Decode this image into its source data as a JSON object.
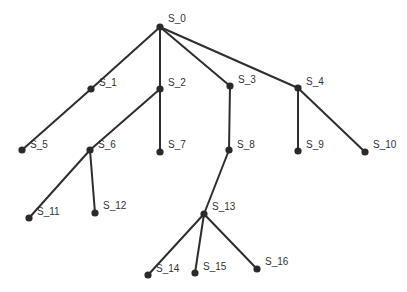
{
  "diagram": {
    "type": "tree",
    "colors": {
      "edge": "#2e2e2e",
      "node": "#2a2a2a",
      "label": "#333333",
      "background": "#ffffff"
    },
    "nodes": [
      {
        "id": "S_0",
        "label": "S_0",
        "x": 160,
        "y": 27,
        "lx": 168,
        "ly": 22
      },
      {
        "id": "S_1",
        "label": "S_1",
        "x": 91,
        "y": 89,
        "lx": 99,
        "ly": 86
      },
      {
        "id": "S_2",
        "label": "S_2",
        "x": 160,
        "y": 89,
        "lx": 168,
        "ly": 86
      },
      {
        "id": "S_3",
        "label": "S_3",
        "x": 230,
        "y": 86,
        "lx": 238,
        "ly": 83
      },
      {
        "id": "S_4",
        "label": "S_4",
        "x": 298,
        "y": 88,
        "lx": 306,
        "ly": 85
      },
      {
        "id": "S_5",
        "label": "S_5",
        "x": 22,
        "y": 150,
        "lx": 30,
        "ly": 148
      },
      {
        "id": "S_6",
        "label": "S_6",
        "x": 90,
        "y": 150,
        "lx": 98,
        "ly": 148
      },
      {
        "id": "S_7",
        "label": "S_7",
        "x": 160,
        "y": 152,
        "lx": 168,
        "ly": 148
      },
      {
        "id": "S_8",
        "label": "S_8",
        "x": 229,
        "y": 150,
        "lx": 237,
        "ly": 148
      },
      {
        "id": "S_9",
        "label": "S_9",
        "x": 298,
        "y": 151,
        "lx": 306,
        "ly": 148
      },
      {
        "id": "S_10",
        "label": "S_10",
        "x": 365,
        "y": 152,
        "lx": 373,
        "ly": 148
      },
      {
        "id": "S_11",
        "label": "S_11",
        "x": 29,
        "y": 218,
        "lx": 37,
        "ly": 215
      },
      {
        "id": "S_12",
        "label": "S_12",
        "x": 95,
        "y": 213,
        "lx": 103,
        "ly": 209
      },
      {
        "id": "S_13",
        "label": "S_13",
        "x": 204,
        "y": 214,
        "lx": 212,
        "ly": 210
      },
      {
        "id": "S_14",
        "label": "S_14",
        "x": 148,
        "y": 275,
        "lx": 156,
        "ly": 272
      },
      {
        "id": "S_15",
        "label": "S_15",
        "x": 195,
        "y": 273,
        "lx": 203,
        "ly": 270
      },
      {
        "id": "S_16",
        "label": "S_16",
        "x": 257,
        "y": 269,
        "lx": 265,
        "ly": 265
      }
    ],
    "edges": [
      {
        "from": "S_0",
        "to": "S_1"
      },
      {
        "from": "S_0",
        "to": "S_2"
      },
      {
        "from": "S_0",
        "to": "S_3"
      },
      {
        "from": "S_0",
        "to": "S_4"
      },
      {
        "from": "S_1",
        "to": "S_5"
      },
      {
        "from": "S_2",
        "to": "S_6"
      },
      {
        "from": "S_2",
        "to": "S_7"
      },
      {
        "from": "S_3",
        "to": "S_8"
      },
      {
        "from": "S_4",
        "to": "S_9"
      },
      {
        "from": "S_4",
        "to": "S_10"
      },
      {
        "from": "S_6",
        "to": "S_11"
      },
      {
        "from": "S_6",
        "to": "S_12"
      },
      {
        "from": "S_8",
        "to": "S_13"
      },
      {
        "from": "S_13",
        "to": "S_14"
      },
      {
        "from": "S_13",
        "to": "S_15"
      },
      {
        "from": "S_13",
        "to": "S_16"
      }
    ]
  }
}
